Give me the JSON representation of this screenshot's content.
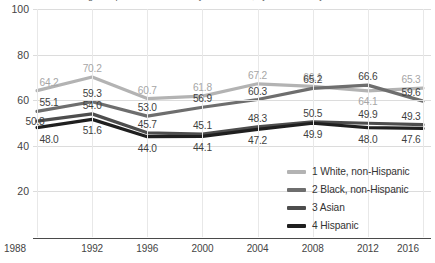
{
  "title": "Adult children who grew up in families with very low income, by race/ethnicity",
  "chart_data": {
    "type": "line",
    "title": "Adult children who grew up in families with very low income, by race/ethnicity",
    "xlabel": "",
    "ylabel": "",
    "x": [
      1988,
      1992,
      1996,
      2000,
      2004,
      2008,
      2012,
      2016
    ],
    "categories": [
      "1988",
      "1992",
      "1996",
      "2000",
      "2004",
      "2008",
      "2012",
      "2016"
    ],
    "ylim": [
      0,
      100
    ],
    "yticks": [
      20,
      40,
      60,
      80,
      100
    ],
    "ytick_labels": [
      "20",
      "40",
      "60",
      "80",
      "100"
    ],
    "grid": true,
    "legend_position": "inside-bottom-right",
    "series": [
      {
        "name": "1 White, non-Hispanic",
        "color": "#b3b3b3",
        "values": [
          64.2,
          70.2,
          60.7,
          61.8,
          67.2,
          66.1,
          64.1,
          65.3
        ],
        "labels": [
          "64.2",
          "70.2",
          "60.7",
          "61.8",
          "67.2",
          "66.1",
          "64.1",
          "65.3"
        ]
      },
      {
        "name": "2 Black, non-Hispanic",
        "color": "#6e6e6e",
        "values": [
          55.1,
          59.3,
          53.0,
          56.9,
          60.3,
          65.2,
          66.6,
          59.6
        ],
        "labels": [
          "55.1",
          "59.3",
          "53.0",
          "56.9",
          "60.3",
          "65.2",
          "66.6",
          "59.6"
        ]
      },
      {
        "name": "3 Asian",
        "color": "#4d4d4d",
        "values": [
          50.8,
          54.0,
          45.7,
          45.1,
          48.3,
          50.5,
          49.9,
          49.3
        ],
        "labels": [
          "50.8",
          "54.0",
          "45.7",
          "45.1",
          "48.3",
          "50.5",
          "49.9",
          "49.3"
        ]
      },
      {
        "name": "4 Hispanic",
        "color": "#1f1f1f",
        "values": [
          48.0,
          51.6,
          44.0,
          44.1,
          47.2,
          49.9,
          48.0,
          47.6
        ],
        "labels": [
          "48.0",
          "51.6",
          "44.0",
          "44.1",
          "47.2",
          "49.9",
          "48.0",
          "47.6"
        ]
      }
    ]
  },
  "axes": {
    "y_labels": [
      "100",
      "80",
      "60",
      "40",
      "20"
    ],
    "x_labels": [
      "1988",
      "1992",
      "1996",
      "2000",
      "2004",
      "2008",
      "2012",
      "2016"
    ]
  },
  "legend": {
    "items": [
      {
        "label": "1 White, non-Hispanic",
        "color": "#b3b3b3"
      },
      {
        "label": "2 Black, non-Hispanic",
        "color": "#6e6e6e"
      },
      {
        "label": "3 Asian",
        "color": "#4d4d4d"
      },
      {
        "label": "4 Hispanic",
        "color": "#1f1f1f"
      }
    ]
  }
}
